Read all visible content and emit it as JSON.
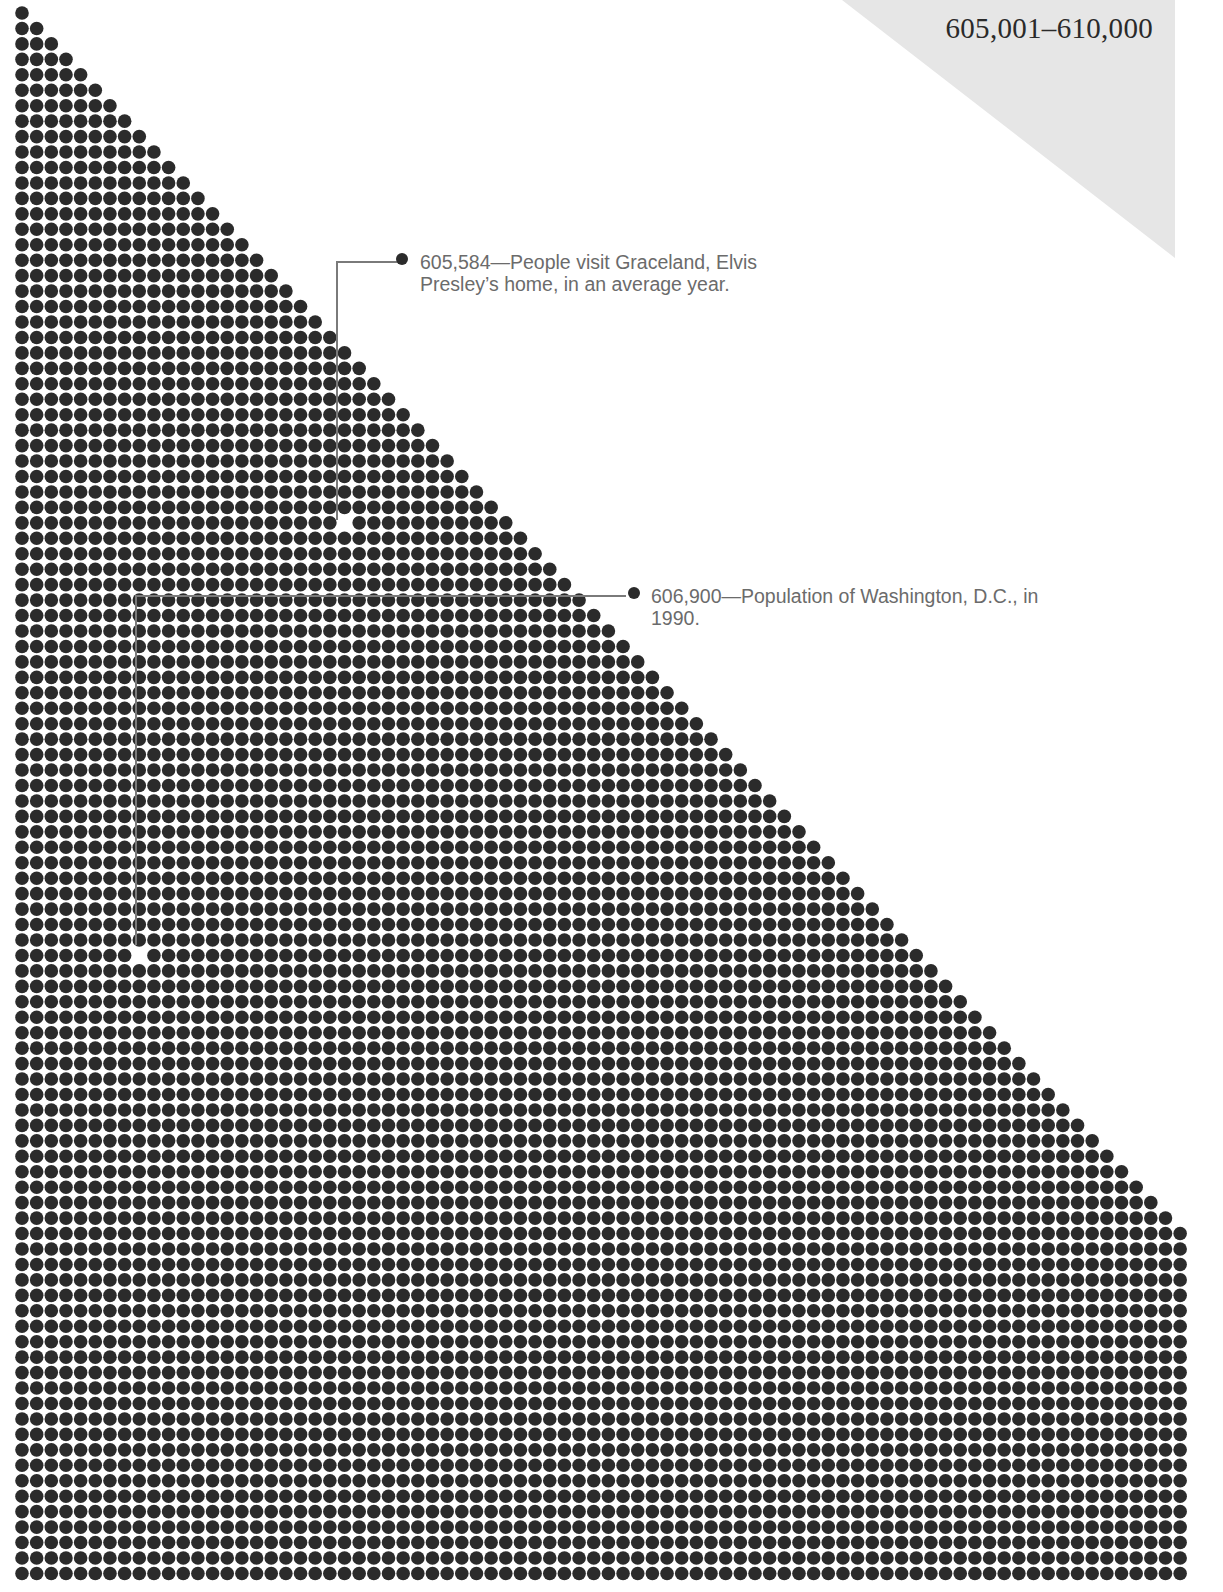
{
  "header": {
    "range_title": "605,001–610,000"
  },
  "annotations": [
    {
      "value": "605,584",
      "dash": "—",
      "line1": "People visit Graceland, Elvis",
      "line2": "Presley’s home, in an average year."
    },
    {
      "value": "606,900",
      "dash": "—",
      "line1": "Population of Washington, D.C., in",
      "line2": "1990."
    }
  ],
  "colors": {
    "dot": "#2b2b2b",
    "leader": "#7a7a7a",
    "corner_tab": "#e6e6e6",
    "text": "#6b6b6b"
  },
  "chart_data": {
    "type": "scatter",
    "title": "605,001–610,000",
    "range_start": 605001,
    "range_end": 610000,
    "total_dots": 5000,
    "grid": {
      "columns": 80,
      "rows": 102,
      "triangle_rows": 80,
      "full_rows": 22,
      "origin_x": 22,
      "origin_y": 13,
      "step_x": 14.66,
      "step_y": 15.45,
      "dot_radius": 6.8
    },
    "highlights": [
      {
        "number": 605584,
        "index": 583,
        "row": 33,
        "col": 22,
        "label": "605,584—People visit Graceland, Elvis Presley’s home, in an average year."
      },
      {
        "number": 606900,
        "index": 1899,
        "row": 61,
        "col": 8,
        "label": "606,900—Population of Washington, D.C., in 1990."
      }
    ],
    "xlabel": "",
    "ylabel": "",
    "grid_lines": false,
    "legend": "none"
  }
}
